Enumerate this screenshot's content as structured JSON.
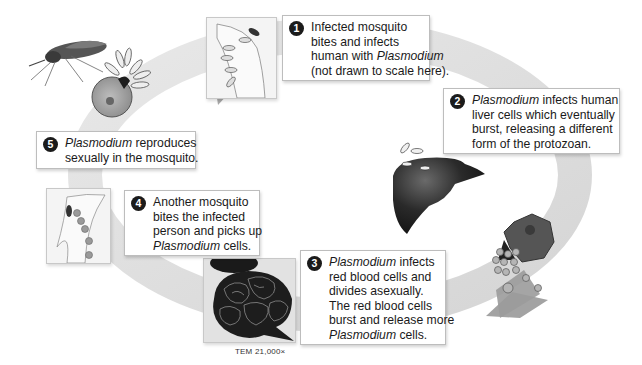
{
  "diagram": {
    "colors": {
      "ring": "#dcdcdc",
      "arrow": "#a9a9a9",
      "box_border": "#bdbdbd",
      "badge": "#1b1b1b",
      "liver": "#2a2a2a"
    },
    "steps": [
      {
        "number": "1",
        "lines": [
          {
            "pre": "Infected mosquito",
            "em": "",
            "post": ""
          },
          {
            "pre": "bites and infects",
            "em": "",
            "post": ""
          },
          {
            "pre": "human with ",
            "em": "Plasmodium",
            "post": ""
          },
          {
            "pre": "(not drawn to scale here).",
            "em": "",
            "post": ""
          }
        ]
      },
      {
        "number": "2",
        "lines": [
          {
            "pre": "",
            "em": "Plasmodium",
            "post": " infects human"
          },
          {
            "pre": "liver cells which eventually",
            "em": "",
            "post": ""
          },
          {
            "pre": "burst, releasing a different",
            "em": "",
            "post": ""
          },
          {
            "pre": "form of the protozoan.",
            "em": "",
            "post": ""
          }
        ]
      },
      {
        "number": "3",
        "lines": [
          {
            "pre": "",
            "em": "Plasmodium",
            "post": " infects"
          },
          {
            "pre": "red blood cells and",
            "em": "",
            "post": ""
          },
          {
            "pre": "divides asexually.",
            "em": "",
            "post": ""
          },
          {
            "pre": "The red blood cells",
            "em": "",
            "post": ""
          },
          {
            "pre": "burst and release more",
            "em": "",
            "post": ""
          },
          {
            "pre": "",
            "em": "Plasmodium",
            "post": " cells."
          }
        ]
      },
      {
        "number": "4",
        "lines": [
          {
            "pre": "Another mosquito",
            "em": "",
            "post": ""
          },
          {
            "pre": "bites the infected",
            "em": "",
            "post": ""
          },
          {
            "pre": "person and picks up",
            "em": "",
            "post": ""
          },
          {
            "pre": "",
            "em": "Plasmodium",
            "post": " cells."
          }
        ]
      },
      {
        "number": "5",
        "lines": [
          {
            "pre": "",
            "em": "Plasmodium",
            "post": " reproduces"
          },
          {
            "pre": "sexually in the mosquito.",
            "em": "",
            "post": ""
          }
        ]
      }
    ],
    "micrograph_caption": "TEM 21,000×",
    "illustrations": [
      "mosquito-icon",
      "mosquito-gut-cell-icon",
      "arm-bite-panel-icon",
      "liver-icon",
      "liver-cell-bursting-icon",
      "red-blood-cells-icon",
      "micrograph-panel-icon",
      "arm-blood-cells-panel-icon"
    ]
  }
}
